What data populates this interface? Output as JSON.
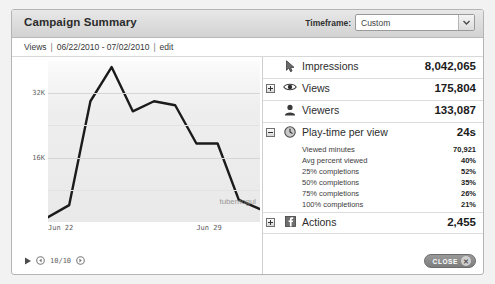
{
  "window": {
    "title": "Campaign Summary"
  },
  "header": {
    "timeframe_label": "Timeframe:",
    "timeframe_value": "Custom",
    "timeframe_options": [
      "Custom"
    ]
  },
  "subheader": {
    "metric": "Views",
    "sep1": "|",
    "date_range": "06/22/2010 - 07/02/2010",
    "sep2": "|",
    "edit": "edit"
  },
  "player": {
    "play_icon": "play-icon",
    "prev_icon": "step-back-icon",
    "next_icon": "step-forward-icon",
    "count": "10/10"
  },
  "watermark": "tubemogul",
  "metrics": [
    {
      "id": "impressions",
      "icon": "cursor-arrow-icon",
      "expander": null,
      "label": "Impressions",
      "value": "8,042,065"
    },
    {
      "id": "views",
      "icon": "eye-icon",
      "expander": "plus",
      "label": "Views",
      "value": "175,804"
    },
    {
      "id": "viewers",
      "icon": "person-icon",
      "expander": null,
      "label": "Viewers",
      "value": "133,087"
    },
    {
      "id": "play-time-per-view",
      "icon": "clock-icon",
      "expander": "minus",
      "label": "Play-time per view",
      "value": "24s",
      "subrows": [
        {
          "label": "Viewed minutes",
          "value": "70,921"
        },
        {
          "label": "Avg percent viewed",
          "value": "40%"
        },
        {
          "label": "25% completions",
          "value": "52%"
        },
        {
          "label": "50% completions",
          "value": "35%"
        },
        {
          "label": "75% completions",
          "value": "26%"
        },
        {
          "label": "100% completions",
          "value": "21%"
        }
      ]
    },
    {
      "id": "actions",
      "icon": "facebook-icon",
      "expander": "plus",
      "label": "Actions",
      "value": "2,455"
    }
  ],
  "footer": {
    "close_label": "CLOSE",
    "close_icon": "close-x-icon"
  },
  "chart_data": {
    "type": "line",
    "title": "",
    "xlabel": "",
    "ylabel": "Views",
    "ylim": [
      0,
      40000
    ],
    "yticks": [
      16000,
      32000
    ],
    "ytick_labels": [
      "16K",
      "32K"
    ],
    "grid": true,
    "legend": false,
    "x": [
      "Jun 22",
      "Jun 23",
      "Jun 24",
      "Jun 25",
      "Jun 26",
      "Jun 27",
      "Jun 28",
      "Jun 29",
      "Jun 30",
      "Jul 01",
      "Jul 02"
    ],
    "xtick_labels": [
      "Jun 22",
      "Jun 29"
    ],
    "xtick_positions": [
      0,
      7
    ],
    "series": [
      {
        "name": "Views",
        "values": [
          1200,
          4200,
          30000,
          38500,
          27500,
          30000,
          29000,
          19500,
          19500,
          5500,
          3200
        ]
      }
    ]
  }
}
